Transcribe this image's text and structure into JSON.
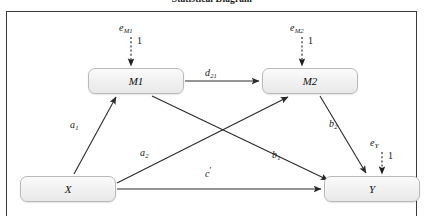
{
  "title": "Statistical Diagram",
  "frame": {
    "border_color": "#3a3a40",
    "background": "#ffffff"
  },
  "diagram": {
    "type": "path-diagram",
    "model": "serial-mediation",
    "node_fill": "#f1f1f1",
    "node_border": "#b9b9b9",
    "arrow_color": "#2a2a2e",
    "nodes": [
      {
        "id": "X",
        "label": "X",
        "role": "predictor"
      },
      {
        "id": "M1",
        "label": "M1",
        "role": "mediator"
      },
      {
        "id": "M2",
        "label": "M2",
        "role": "mediator"
      },
      {
        "id": "Y",
        "label": "Y",
        "role": "outcome"
      }
    ],
    "disturbances": [
      {
        "id": "eM1",
        "symbol": "e",
        "subscript": "M1",
        "target": "M1",
        "loading": "1",
        "style": "dashed"
      },
      {
        "id": "eM2",
        "symbol": "e",
        "subscript": "M2",
        "target": "M2",
        "loading": "1",
        "style": "dashed"
      },
      {
        "id": "eY",
        "symbol": "e",
        "subscript": "Y",
        "target": "Y",
        "loading": "1",
        "style": "dashed"
      }
    ],
    "paths": [
      {
        "id": "a1",
        "from": "X",
        "to": "M1",
        "symbol": "a",
        "subscript": "1",
        "prime": false
      },
      {
        "id": "a2",
        "from": "X",
        "to": "M2",
        "symbol": "a",
        "subscript": "2",
        "prime": false
      },
      {
        "id": "d21",
        "from": "M1",
        "to": "M2",
        "symbol": "d",
        "subscript": "21",
        "prime": false
      },
      {
        "id": "b1",
        "from": "M1",
        "to": "Y",
        "symbol": "b",
        "subscript": "1",
        "prime": false
      },
      {
        "id": "b2",
        "from": "M2",
        "to": "Y",
        "symbol": "b",
        "subscript": "2",
        "prime": false
      },
      {
        "id": "cp",
        "from": "X",
        "to": "Y",
        "symbol": "c",
        "subscript": "",
        "prime": true
      }
    ]
  }
}
